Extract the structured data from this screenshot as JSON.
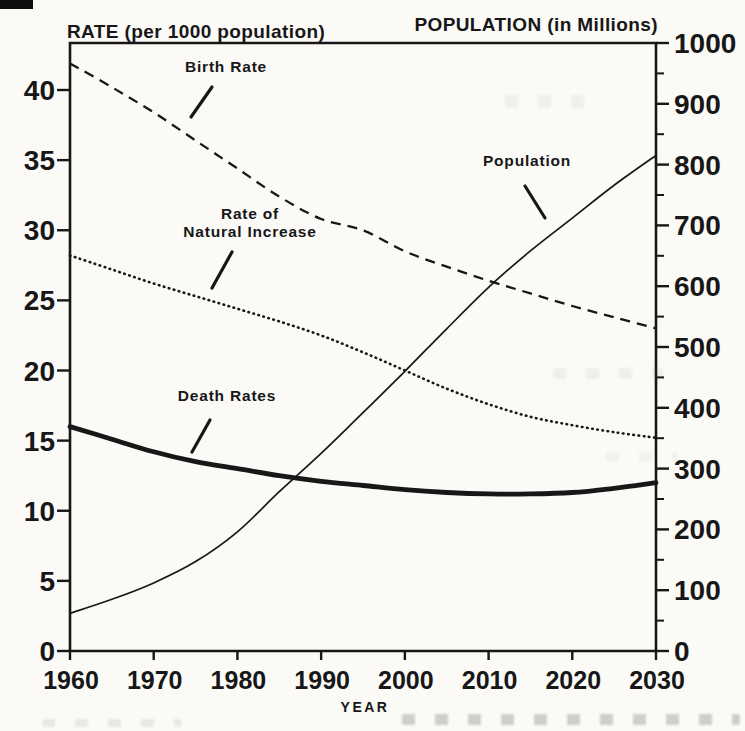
{
  "page": {
    "paper": "#fbfaf7",
    "ink": "#171717"
  },
  "chart_data": {
    "type": "line",
    "title_left": "RATE (per 1000 population)",
    "title_right": "POPULATION (in Millions)",
    "xlabel": "YEAR",
    "grid": false,
    "x": [
      1960,
      1965,
      1970,
      1975,
      1980,
      1985,
      1990,
      1995,
      2000,
      2005,
      2010,
      2015,
      2020,
      2025,
      2030
    ],
    "x_ticks": [
      1960,
      1970,
      1980,
      1990,
      2000,
      2010,
      2020,
      2030
    ],
    "left_axis": {
      "title": "RATE (per 1000 population)",
      "min": 0,
      "max": 43.3,
      "ticks": [
        0,
        5,
        10,
        15,
        20,
        25,
        30,
        35,
        40
      ]
    },
    "right_axis": {
      "title": "POPULATION (in Millions)",
      "min": 0,
      "max": 1000,
      "ticks": [
        0,
        100,
        200,
        300,
        400,
        500,
        600,
        700,
        800,
        900,
        1000
      ],
      "minor_tick_step": 50
    },
    "series": [
      {
        "name": "Birth Rate",
        "axis": "left",
        "line_style": "dashed",
        "values": [
          41.9,
          40.2,
          38.4,
          36.4,
          34.4,
          32.4,
          30.8,
          30.0,
          28.5,
          27.4,
          26.4,
          25.5,
          24.6,
          23.8,
          23.0
        ]
      },
      {
        "name": "Rate of Natural Increase",
        "axis": "left",
        "line_style": "dotted",
        "values": [
          28.2,
          27.2,
          26.2,
          25.3,
          24.4,
          23.5,
          22.5,
          21.3,
          20.0,
          18.7,
          17.6,
          16.7,
          16.1,
          15.6,
          15.2
        ]
      },
      {
        "name": "Death Rates",
        "axis": "left",
        "line_style": "thick-solid",
        "values": [
          16.0,
          15.1,
          14.2,
          13.5,
          13.0,
          12.5,
          12.1,
          11.8,
          11.5,
          11.3,
          11.2,
          11.2,
          11.3,
          11.6,
          12.0
        ]
      },
      {
        "name": "Population",
        "axis": "right",
        "line_style": "thin-solid",
        "values": [
          62,
          85,
          112,
          147,
          196,
          262,
          325,
          392,
          460,
          530,
          598,
          658,
          712,
          766,
          815
        ]
      }
    ],
    "annotations": [
      {
        "text": "Birth Rate",
        "lines": [
          "Birth Rate"
        ],
        "x": 226,
        "y": 72,
        "pointer": {
          "x1": 212,
          "y1": 87,
          "x2": 191,
          "y2": 117
        }
      },
      {
        "text": "Rate of Natural Increase",
        "lines": [
          "Rate of",
          "Natural Increase"
        ],
        "x": 250,
        "y": 219,
        "pointer": {
          "x1": 232,
          "y1": 252,
          "x2": 212,
          "y2": 288
        }
      },
      {
        "text": "Death Rates",
        "lines": [
          "Death Rates"
        ],
        "x": 227,
        "y": 401,
        "pointer": {
          "x1": 210,
          "y1": 420,
          "x2": 192,
          "y2": 452
        }
      },
      {
        "text": "Population",
        "lines": [
          "Population"
        ],
        "x": 527,
        "y": 166,
        "pointer": {
          "x1": 525,
          "y1": 186,
          "x2": 545,
          "y2": 218
        }
      }
    ]
  }
}
